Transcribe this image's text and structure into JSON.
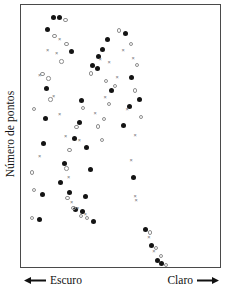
{
  "figure": {
    "y_axis_label": "Número de pontos",
    "x_axis_left_label": "Escuro",
    "x_axis_right_label": "Claro",
    "left_arrow_icon": "arrow-left-icon",
    "right_arrow_icon": "arrow-right-icon",
    "frame_color": "#4a4a4a",
    "background_color": "#ffffff"
  },
  "chart_data": {
    "type": "scatter",
    "title": "",
    "xlabel": "",
    "ylabel": "Número de pontos",
    "xlim": [
      0,
      100
    ],
    "ylim": [
      0,
      100
    ],
    "grid": false,
    "legend": "none",
    "axis_annotations": {
      "x_left": "Escuro",
      "x_right": "Claro",
      "x_left_arrow": "left",
      "x_right_arrow": "right"
    },
    "tick_labels": {
      "x": [],
      "y": []
    },
    "marker_colors": {
      "filled": "#141414",
      "open": "#8e8e8e",
      "cross": "#6f6f6f"
    },
    "series": [
      {
        "name": "filled-circle",
        "marker": "filled",
        "points": [
          [
            16.4,
            95.1
          ],
          [
            19.4,
            95.1
          ],
          [
            13.4,
            90.6
          ],
          [
            25.4,
            82.4
          ],
          [
            35.8,
            76.8
          ],
          [
            38.3,
            75.7
          ],
          [
            12.9,
            68.2
          ],
          [
            12.4,
            56.6
          ],
          [
            30.3,
            63.5
          ],
          [
            29.3,
            55.1
          ],
          [
            26.9,
            48.9
          ],
          [
            11.4,
            47.3
          ],
          [
            10.9,
            27.6
          ],
          [
            9.4,
            18.0
          ],
          [
            21.9,
            39.5
          ],
          [
            19.9,
            32.2
          ],
          [
            24.4,
            28.4
          ],
          [
            27.4,
            21.8
          ],
          [
            30.8,
            21.3
          ],
          [
            43.3,
            86.9
          ],
          [
            40.8,
            83.2
          ],
          [
            38.8,
            80.2
          ],
          [
            32.8,
            45.7
          ],
          [
            34.8,
            37.2
          ],
          [
            32.3,
            26.8
          ],
          [
            36.3,
            17.4
          ],
          [
            45.3,
            67.3
          ],
          [
            52.3,
            89.1
          ],
          [
            55.3,
            72.4
          ],
          [
            54.3,
            61.1
          ],
          [
            51.3,
            54.1
          ],
          [
            59.3,
            63.9
          ],
          [
            56.3,
            34.0
          ],
          [
            62.8,
            14.4
          ],
          [
            65.8,
            8.3
          ],
          [
            68.8,
            2.6
          ],
          [
            70.8,
            1.3
          ]
        ]
      },
      {
        "name": "open-circle",
        "marker": "open",
        "points": [
          [
            22.4,
            94.3
          ],
          [
            16.9,
            88.2
          ],
          [
            22.9,
            85.2
          ],
          [
            20.4,
            78.4
          ],
          [
            10.9,
            73.6
          ],
          [
            13.9,
            71.9
          ],
          [
            14.9,
            64.0
          ],
          [
            6.4,
            60.4
          ],
          [
            5.4,
            36.1
          ],
          [
            6.4,
            29.3
          ],
          [
            5.4,
            18.6
          ],
          [
            31.3,
            60.6
          ],
          [
            27.9,
            53.4
          ],
          [
            24.4,
            44.7
          ],
          [
            22.9,
            37.6
          ],
          [
            23.4,
            26.3
          ],
          [
            26.4,
            22.6
          ],
          [
            30.3,
            19.4
          ],
          [
            33.3,
            18.6
          ],
          [
            35.3,
            73.9
          ],
          [
            42.8,
            71.0
          ],
          [
            47.3,
            69.0
          ],
          [
            44.3,
            62.3
          ],
          [
            41.8,
            56.4
          ],
          [
            38.8,
            53.6
          ],
          [
            40.8,
            48.4
          ],
          [
            49.3,
            90.3
          ],
          [
            55.3,
            85.0
          ],
          [
            58.3,
            77.0
          ],
          [
            57.3,
            67.3
          ],
          [
            60.3,
            57.3
          ],
          [
            64.8,
            13.2
          ],
          [
            67.8,
            7.2
          ],
          [
            70.3,
            4.1
          ],
          [
            72.8,
            0.8
          ]
        ]
      },
      {
        "name": "cross",
        "marker": "cross",
        "points": [
          [
            19.4,
            86.9
          ],
          [
            13.4,
            82.5
          ],
          [
            17.9,
            81.6
          ],
          [
            9.4,
            73.2
          ],
          [
            16.4,
            65.0
          ],
          [
            19.4,
            58.3
          ],
          [
            9.4,
            42.1
          ],
          [
            22.4,
            50.0
          ],
          [
            29.3,
            48.4
          ],
          [
            23.9,
            34.3
          ],
          [
            25.4,
            24.6
          ],
          [
            28.4,
            22.2
          ],
          [
            32.3,
            20.0
          ],
          [
            39.8,
            79.1
          ],
          [
            44.3,
            78.0
          ],
          [
            48.3,
            72.3
          ],
          [
            42.3,
            64.6
          ],
          [
            37.3,
            58.4
          ],
          [
            51.3,
            82.8
          ],
          [
            56.3,
            79.4
          ],
          [
            53.3,
            60.3
          ],
          [
            57.3,
            50.1
          ],
          [
            55.3,
            40.5
          ],
          [
            57.3,
            27.0
          ],
          [
            57.8,
            25.5
          ],
          [
            64.3,
            11.1
          ],
          [
            66.8,
            5.9
          ]
        ]
      }
    ]
  }
}
